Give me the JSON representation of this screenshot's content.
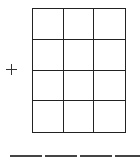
{
  "puzzle": {
    "operator": "+",
    "operator_icon": "plus-icon",
    "grid": {
      "rows": 4,
      "columns": 3
    },
    "answer_blanks": 4
  }
}
